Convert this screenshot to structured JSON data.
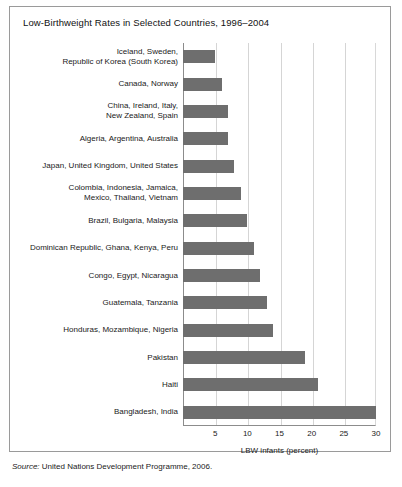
{
  "figure": {
    "title": "Low-Birthweight Rates in Selected Countries, 1996–2004",
    "source_label": "Source:",
    "source_text": "United Nations Development Programme, 2006."
  },
  "chart_data": {
    "type": "bar",
    "orientation": "horizontal",
    "title": "Low-Birthweight Rates in Selected Countries, 1996–2004",
    "xlabel": "LBW infants (percent)",
    "ylabel": "",
    "xlim": [
      0,
      30
    ],
    "xticks": [
      5,
      10,
      15,
      20,
      25,
      30
    ],
    "xtick_labels": [
      "5",
      "10",
      "15",
      "20",
      "25",
      "30"
    ],
    "grid": true,
    "legend": "none",
    "bar_color": "#6e6e6e",
    "categories": [
      "Iceland, Sweden,\nRepublic of Korea (South Korea)",
      "Canada, Norway",
      "China, Ireland, Italy,\nNew Zealand, Spain",
      "Algeria, Argentina, Australia",
      "Japan, United Kingdom, United States",
      "Colombia, Indonesia, Jamaica,\nMexico, Thailand, Vietnam",
      "Brazil, Bulgaria, Malaysia",
      "Dominican Republic, Ghana, Kenya, Peru",
      "Congo, Egypt, Nicaragua",
      "Guatemala, Tanzania",
      "Honduras, Mozambique, Nigeria",
      "Pakistan",
      "Haiti",
      "Bangladesh, India"
    ],
    "values": [
      5,
      6,
      7,
      7,
      8,
      9,
      10,
      11,
      12,
      13,
      14,
      19,
      21,
      30
    ]
  }
}
